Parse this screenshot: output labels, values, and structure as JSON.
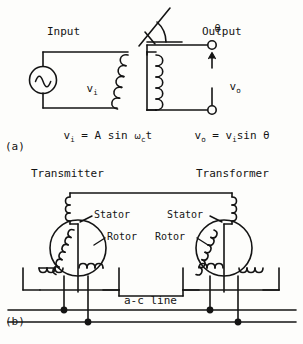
{
  "figure": {
    "panel_a": {
      "tag": "(a)",
      "title_input": "Input",
      "title_output": "Output",
      "angle_symbol": "θ",
      "source_label_v": "v",
      "source_label_sub": "i",
      "output_label_v": "v",
      "output_label_sub": "o",
      "equation_left": {
        "lhs_v": "v",
        "lhs_sub": "i",
        "eq": "=",
        "rhs_a": "A sin",
        "omega": "ω",
        "omega_sub": "c",
        "rhs_t": "t"
      },
      "equation_right": {
        "lhs_v": "v",
        "lhs_sub": "o",
        "eq": "=",
        "rhs_v": "v",
        "rhs_sub": "i",
        "rhs_tail": "sin",
        "theta": "θ"
      },
      "icons": {
        "ac_source": "ac-source-icon",
        "coil": "inductor-coil-icon",
        "terminal": "open-terminal-icon",
        "arrow": "voltage-arrow-icon"
      }
    },
    "panel_b": {
      "tag": "(b)",
      "title_left": "Transmitter",
      "title_right": "Transformer",
      "stator_left": "Stator",
      "rotor_left": "Rotor",
      "stator_right": "Stator",
      "rotor_right": "Rotor",
      "ac_line": "a-c line",
      "icons": {
        "synchro": "synchro-body-icon",
        "stator_coil": "stator-winding-icon",
        "rotor_coil": "rotor-winding-icon",
        "junction": "wire-junction-dot-icon"
      }
    },
    "colors": {
      "ink": "#141414",
      "paper": "#fdfdfb"
    }
  }
}
